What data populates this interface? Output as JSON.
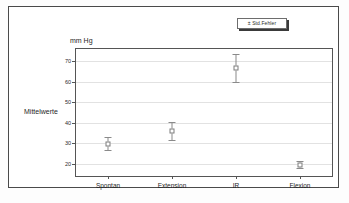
{
  "legend": {
    "label": "± Std.Fehler"
  },
  "axes": {
    "unit_label": "mm Hg",
    "y_title": "Mittelwerte",
    "y_ticks": [
      20,
      30,
      40,
      50,
      60,
      70
    ],
    "y_min": 14,
    "y_max": 76
  },
  "chart_data": {
    "type": "scatter",
    "title": "",
    "subtitle": "",
    "xlabel": "",
    "ylabel": "Mittelwerte",
    "unit": "mm Hg",
    "ylim": [
      14,
      76
    ],
    "ytick_labels": [
      "20",
      "30",
      "40",
      "50",
      "60",
      "70"
    ],
    "grid": true,
    "legend_position": "top-right",
    "legend_entries": [
      "± Std.Fehler"
    ],
    "error_type": "standard-error",
    "categories": [
      "Spontan",
      "Extension",
      "IR",
      "Flexion"
    ],
    "series": [
      {
        "name": "Mittelwerte",
        "values": [
          29.8,
          36.0,
          66.8,
          19.6
        ],
        "error_low": [
          26.8,
          31.8,
          59.8,
          17.8
        ],
        "error_high": [
          33.0,
          40.2,
          73.8,
          21.4
        ]
      }
    ]
  }
}
